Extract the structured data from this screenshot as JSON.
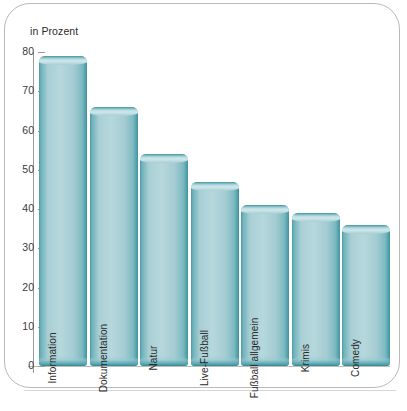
{
  "axis_note": "in Prozent",
  "chart_data": {
    "type": "bar",
    "title": "",
    "subtitle": "",
    "xlabel": "",
    "ylabel": "in Prozent",
    "ylim": [
      0,
      80
    ],
    "yticks": [
      0,
      10,
      20,
      30,
      40,
      50,
      60,
      70,
      80
    ],
    "ytick_labels": [
      "0",
      "10",
      "20",
      "30",
      "40",
      "50",
      "60",
      "70",
      "80"
    ],
    "grid": false,
    "legend": false,
    "categories": [
      "Information",
      "Dokumentation",
      "Natur",
      "Live-Fußball",
      "Fußball allgemein",
      "Krimis",
      "Comedy"
    ],
    "values": [
      79,
      66,
      54,
      47,
      41,
      39,
      36
    ],
    "bar_color": "#a9cfd5",
    "bar_edge_color": "#3f93a0",
    "axis_color": "#9a9a9a",
    "text_color": "#2b2b2b",
    "background": "#ffffff"
  }
}
